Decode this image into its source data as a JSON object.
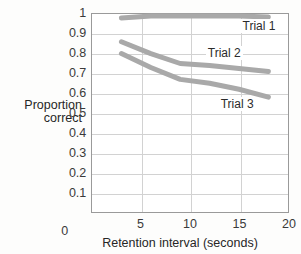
{
  "chart_data": {
    "type": "line",
    "title": "",
    "xlabel": "Retention interval (seconds)",
    "ylabel": "Proportion correct",
    "ylabel_line1": "Proportion",
    "ylabel_line2": "correct",
    "xlim": [
      0,
      20
    ],
    "ylim": [
      0,
      1
    ],
    "xticks": [
      "0",
      "5",
      "10",
      "15",
      "20"
    ],
    "xtick_values": [
      0,
      5,
      10,
      15,
      20
    ],
    "yticks": [
      "0.1",
      "0.2",
      "0.3",
      "0.4",
      "0.5",
      "0.6",
      "0.7",
      "0.8",
      "0.9",
      "1"
    ],
    "ytick_values": [
      0.1,
      0.2,
      0.3,
      0.4,
      0.5,
      0.6,
      0.7,
      0.8,
      0.9,
      1
    ],
    "y_origin_label": "0",
    "grid": "both",
    "legend_position": "inline-annotations",
    "series_color": "#a9a9a9",
    "line_width": 5,
    "series": [
      {
        "name": "Trial 1",
        "label": "Trial 1",
        "x": [
          3,
          6,
          9,
          12,
          15,
          18
        ],
        "values": [
          0.98,
          0.99,
          0.99,
          0.99,
          0.99,
          0.985
        ],
        "label_x": 15.1,
        "label_y": 0.935
      },
      {
        "name": "Trial 2",
        "label": "Trial 2",
        "x": [
          3,
          6,
          9,
          12,
          15,
          18
        ],
        "values": [
          0.86,
          0.8,
          0.75,
          0.74,
          0.725,
          0.71
        ],
        "label_x": 11.6,
        "label_y": 0.8
      },
      {
        "name": "Trial 3",
        "label": "Trial 3",
        "x": [
          3,
          6,
          9,
          12,
          15,
          18
        ],
        "values": [
          0.8,
          0.73,
          0.67,
          0.65,
          0.62,
          0.58
        ],
        "label_x": 12.9,
        "label_y": 0.545
      }
    ]
  }
}
